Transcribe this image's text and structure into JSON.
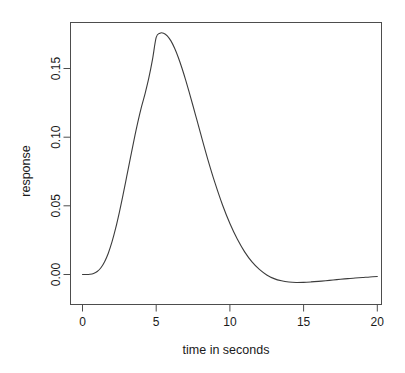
{
  "figure": {
    "background_color": "#ffffff",
    "line_color": "#3c3c3c",
    "axis_color": "#4d4d4d",
    "text_color": "#1a1a1a",
    "title": ""
  },
  "chart_data": {
    "type": "line",
    "title": "",
    "xlabel": "time in seconds",
    "ylabel": "response",
    "xlim": [
      -0.6,
      21.0
    ],
    "ylim": [
      -0.0215,
      0.1845
    ],
    "grid": false,
    "legend": null,
    "xticks": [
      0,
      5,
      10,
      15,
      20
    ],
    "xticklabels": [
      "0",
      "5",
      "10",
      "15",
      "20"
    ],
    "yticks": [
      0.0,
      0.05,
      0.1,
      0.15
    ],
    "yticklabels": [
      "0.00",
      "0.05",
      "0.10",
      "0.15"
    ],
    "series": [
      {
        "name": "response",
        "x": [
          0.0,
          0.25,
          0.5,
          0.75,
          1.0,
          1.25,
          1.5,
          1.75,
          2.0,
          2.25,
          2.5,
          2.75,
          3.0,
          3.25,
          3.5,
          3.75,
          4.0,
          4.25,
          4.5,
          4.75,
          5.0,
          5.25,
          5.5,
          5.75,
          6.0,
          6.25,
          6.5,
          6.75,
          7.0,
          7.25,
          7.5,
          7.75,
          8.0,
          8.5,
          9.0,
          9.5,
          10.0,
          10.5,
          11.0,
          11.5,
          12.0,
          12.5,
          13.0,
          13.5,
          14.0,
          14.5,
          15.0,
          15.5,
          16.0,
          16.5,
          17.0,
          17.5,
          18.0,
          18.5,
          19.0,
          19.5,
          20.0
        ],
        "y": [
          0.0,
          0.0,
          0.0002,
          0.0008,
          0.0022,
          0.0049,
          0.0093,
          0.0155,
          0.0237,
          0.0337,
          0.0453,
          0.058,
          0.0714,
          0.0849,
          0.0982,
          0.1107,
          0.122,
          0.1319,
          0.1431,
          0.1566,
          0.1726,
          0.1757,
          0.1757,
          0.1738,
          0.1701,
          0.1647,
          0.158,
          0.1502,
          0.1416,
          0.1323,
          0.1227,
          0.1129,
          0.1031,
          0.0839,
          0.0663,
          0.0506,
          0.0371,
          0.0258,
          0.0165,
          0.0092,
          0.0037,
          -0.0003,
          -0.003,
          -0.0046,
          -0.0055,
          -0.0058,
          -0.0057,
          -0.0054,
          -0.005,
          -0.0045,
          -0.004,
          -0.0035,
          -0.003,
          -0.0026,
          -0.0022,
          -0.0018,
          -0.0015
        ]
      }
    ],
    "annotations": {
      "peak_time": 5.3,
      "peak_value": 0.176,
      "trough_time": 15.8,
      "trough_value": -0.015,
      "zero_crossing_time": 13.4
    }
  }
}
